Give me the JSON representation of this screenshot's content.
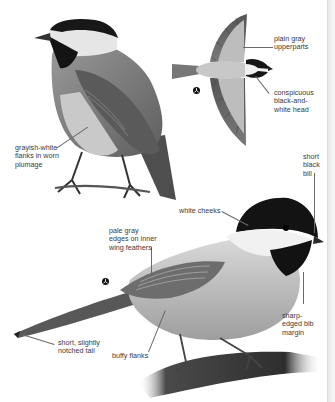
{
  "page": {
    "figures": [
      {
        "id": "perched-rear",
        "description": "perched bird, rear three-quarter view"
      },
      {
        "id": "flight",
        "description": "bird in flight, top view"
      },
      {
        "id": "perched-side",
        "description": "perched bird on branch, side view"
      }
    ]
  },
  "labels": {
    "flanks_worn": "grayish-white\nflanks in worn\nplumage",
    "upperparts": "plain gray\nupperparts",
    "head": "conspicuous\nblack-and-\nwhite head",
    "bill": "short\nblack\nbill",
    "cheeks": "white cheeks",
    "wing_edges": "pale gray\nedges on inner\nwing feathers",
    "tail": "short, slightly\nnotched tail",
    "buffy_flanks": "buffy flanks",
    "bib": "sharp-\nedged bib\nmargin"
  },
  "symbols": {
    "flight_marker": "sex-symbol-icon",
    "perched_marker": "sex-symbol-icon"
  },
  "colors": {
    "label_text": "#3a3a3a",
    "leader_line": "#6a6a6a",
    "cap_black": "#141414",
    "body_gray": "#8c8c8c",
    "cheek_white": "#f2f2f2",
    "wing_dark": "#4a4a4a",
    "branch": "#3c3c3c"
  }
}
